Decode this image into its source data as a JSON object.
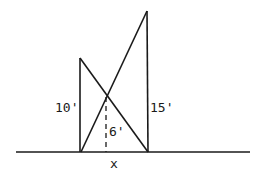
{
  "diagram": {
    "type": "geometry-crossed-ladders",
    "labels": {
      "left_pole_height": "10'",
      "right_pole_height": "15'",
      "intersection_height": "6'",
      "ground_distance": "x"
    },
    "geometry": {
      "ground": {
        "x1": 16,
        "y1": 152,
        "x2": 250,
        "y2": 152
      },
      "left_pole": {
        "x1": 80,
        "y1": 58,
        "x2": 80,
        "y2": 152
      },
      "right_pole": {
        "x1": 147,
        "y1": 11,
        "x2": 148,
        "y2": 152
      },
      "line_left_top_to_right_base": {
        "x1": 80,
        "y1": 58,
        "x2": 148,
        "y2": 152
      },
      "line_left_base_to_right_top": {
        "x1": 81,
        "y1": 152,
        "x2": 147,
        "y2": 11
      },
      "intersection_dashed": {
        "x1": 106,
        "y1": 96,
        "x2": 106,
        "y2": 152
      }
    },
    "colors": {
      "line": "#1a1a1a",
      "background": "#ffffff"
    }
  }
}
